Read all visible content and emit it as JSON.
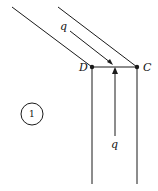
{
  "labels": {
    "point_d": "D",
    "point_c": "C",
    "flow_in": "q",
    "flow_out": "q",
    "region": "1"
  },
  "colors": {
    "stroke": "#1a1a1a",
    "background": "#ffffff"
  }
}
